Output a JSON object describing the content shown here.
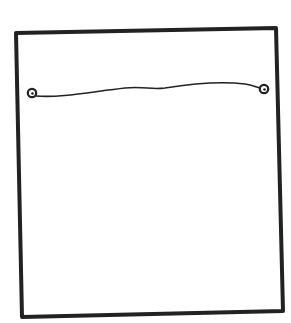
{
  "diagram": {
    "type": "sketch",
    "frame": {
      "corners": [
        [
          16,
          33
        ],
        [
          276,
          28
        ],
        [
          283,
          311
        ],
        [
          22,
          317
        ]
      ],
      "stroke": "#222222",
      "stroke_width": 4
    },
    "string": {
      "start": [
        32,
        94
      ],
      "end": [
        264,
        89
      ],
      "stroke": "#222222"
    },
    "anchors": [
      {
        "name": "left-ring",
        "cx": 32,
        "cy": 93,
        "r": 4
      },
      {
        "name": "right-ring",
        "cx": 264,
        "cy": 89,
        "r": 4
      }
    ]
  }
}
